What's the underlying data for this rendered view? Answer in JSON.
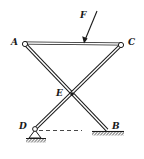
{
  "diagram": {
    "type": "mechanism",
    "points": {
      "A": {
        "label": "A",
        "x": 25,
        "y": 44
      },
      "C": {
        "label": "C",
        "x": 121,
        "y": 45
      },
      "E": {
        "label": "E",
        "x": 72,
        "y": 94
      },
      "D": {
        "label": "D",
        "x": 35,
        "y": 129
      },
      "B": {
        "label": "B",
        "x": 107,
        "y": 130
      }
    },
    "members": [
      {
        "name": "AC",
        "from": "A",
        "to": "C"
      },
      {
        "name": "AB",
        "from": "A",
        "to": "B"
      },
      {
        "name": "CD",
        "from": "C",
        "to": "D"
      }
    ],
    "supports": [
      {
        "at": "D",
        "kind": "pin"
      },
      {
        "at": "B",
        "kind": "smooth-surface"
      }
    ],
    "force": {
      "label": "F",
      "from": [
        97,
        11
      ],
      "to": [
        84,
        43
      ]
    },
    "dashed_reference": {
      "from": "D",
      "to_x": 82
    },
    "colors": {
      "stroke": "#1a1a1a",
      "background": "#ffffff"
    }
  },
  "labels": {
    "A": "A",
    "C": "C",
    "E": "E",
    "D": "D",
    "B": "B",
    "F": "F"
  }
}
